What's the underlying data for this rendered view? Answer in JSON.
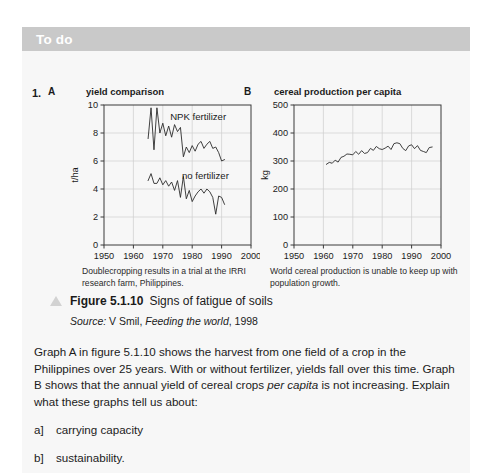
{
  "card": {
    "header_title": "To do",
    "header_bg": "#c9c9c9",
    "body_bg": "#f7f7f7"
  },
  "question": {
    "number": "1."
  },
  "figure": {
    "triangle_icon": "triangle-up-icon",
    "label": "Figure 5.1.10",
    "title": " Signs of fatigue of soils",
    "source_label": "Source:",
    "source_author": " V Smil, ",
    "source_work": "Feeding the world",
    "source_year": ", 1998"
  },
  "body": {
    "paragraph": "Graph A in figure 5.1.10 shows the harvest from one field of a crop in the Philippines over 25 years. With or without fertilizer, yields fall over this time. Graph B shows that the annual yield of cereal crops ",
    "paragraph_italic": "per capita",
    "paragraph_end": " is not increasing. Explain what these graphs tell us about:",
    "items": [
      {
        "marker": "a]",
        "text": "carrying capacity"
      },
      {
        "marker": "b]",
        "text": "sustainability."
      }
    ]
  },
  "chart_data": [
    {
      "id": "A",
      "type": "line",
      "panel_letter": "A",
      "title": "yield comparison",
      "caption": "Doublecropping results in a trial at the IRRI research farm, Philippines.",
      "xlabel": "",
      "ylabel": "t/ha",
      "xlim": [
        1950,
        2000
      ],
      "ylim": [
        0,
        10
      ],
      "xticks": [
        1950,
        1960,
        1970,
        1980,
        1990,
        2000
      ],
      "yticks": [
        0,
        2,
        4,
        6,
        8,
        10
      ],
      "grid": true,
      "legend_position": "inline-annotation",
      "annotations": [
        {
          "text": "NPK fertilizer",
          "x": 1972.5,
          "y": 8.9
        },
        {
          "text": "no fertilizer",
          "x": 1976.5,
          "y": 4.7
        }
      ],
      "series": [
        {
          "name": "NPK fertilizer",
          "x": [
            1965,
            1966,
            1967,
            1968,
            1969,
            1970,
            1971,
            1972,
            1973,
            1974,
            1975,
            1976,
            1977,
            1978,
            1979,
            1980,
            1981,
            1982,
            1983,
            1984,
            1985,
            1986,
            1987,
            1988,
            1989,
            1990,
            1991
          ],
          "values": [
            7.6,
            9.8,
            6.8,
            9.8,
            8.0,
            8.7,
            7.8,
            8.5,
            7.7,
            8.6,
            8.1,
            8.4,
            6.3,
            7.0,
            6.6,
            7.1,
            6.7,
            7.2,
            7.4,
            6.9,
            7.2,
            7.4,
            6.9,
            7.0,
            6.6,
            6.0,
            6.1
          ]
        },
        {
          "name": "no fertilizer",
          "x": [
            1965,
            1966,
            1967,
            1968,
            1969,
            1970,
            1971,
            1972,
            1973,
            1974,
            1975,
            1976,
            1977,
            1978,
            1979,
            1980,
            1981,
            1982,
            1983,
            1984,
            1985,
            1986,
            1987,
            1988,
            1989,
            1990,
            1991
          ],
          "values": [
            4.6,
            5.1,
            4.4,
            4.4,
            4.8,
            4.3,
            4.6,
            4.2,
            4.5,
            3.9,
            4.6,
            3.4,
            4.9,
            3.3,
            3.9,
            3.1,
            3.5,
            3.8,
            4.0,
            3.7,
            4.0,
            3.8,
            3.4,
            2.2,
            3.5,
            3.4,
            2.9
          ]
        }
      ]
    },
    {
      "id": "B",
      "type": "line",
      "panel_letter": "B",
      "title": "cereal production per capita",
      "caption": "World cereal production is unable to keep up with population growth.",
      "xlabel": "",
      "ylabel": "kg",
      "xlim": [
        1950,
        2000
      ],
      "ylim": [
        0,
        500
      ],
      "xticks": [
        1950,
        1960,
        1970,
        1980,
        1990,
        2000
      ],
      "yticks": [
        0,
        100,
        200,
        300,
        400,
        500
      ],
      "grid": true,
      "legend_position": "none",
      "annotations": [],
      "series": [
        {
          "name": "cereal production per capita",
          "x": [
            1961,
            1962,
            1963,
            1964,
            1965,
            1966,
            1967,
            1968,
            1969,
            1970,
            1971,
            1972,
            1973,
            1974,
            1975,
            1976,
            1977,
            1978,
            1979,
            1980,
            1981,
            1982,
            1983,
            1984,
            1985,
            1986,
            1987,
            1988,
            1989,
            1990,
            1991,
            1992,
            1993,
            1994,
            1995,
            1996,
            1997
          ],
          "values": [
            288,
            295,
            292,
            303,
            296,
            313,
            317,
            325,
            324,
            322,
            334,
            324,
            337,
            327,
            330,
            345,
            338,
            352,
            344,
            341,
            346,
            353,
            341,
            362,
            365,
            362,
            345,
            337,
            354,
            358,
            344,
            355,
            338,
            334,
            330,
            348,
            350
          ]
        }
      ]
    }
  ]
}
